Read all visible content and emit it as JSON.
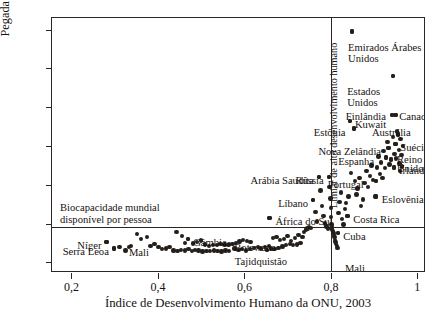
{
  "chart_data": {
    "type": "scatter",
    "title": "",
    "xlabel": "Índice de Desenvolvimento Humano da ONU, 2003",
    "ylabel": "Pegada ecológica per capita",
    "ylabel_plain": "Pegada ecológica ",
    "ylabel_italic": "per capita",
    "xlim": [
      0.155,
      1.02
    ],
    "ylim": [
      -0.55,
      12.6
    ],
    "grid": false,
    "legend": "none",
    "xticks": [
      0.2,
      0.4,
      0.6,
      0.8,
      1.0
    ],
    "xticklabels": [
      "0,2",
      "0,4",
      "0,6",
      "0,8",
      "1"
    ],
    "yticks": [
      0,
      2,
      4,
      6,
      8,
      10,
      12
    ],
    "yticklabels": [
      "0",
      "2",
      "4",
      "6",
      "8",
      "10",
      "12"
    ],
    "reference_lines": [
      {
        "name": "biocapacidade-mundial",
        "orientation": "horizontal",
        "value": 1.8,
        "label": "Biocapacidade mundial disponível por pessoa",
        "label_line1": "Biocapacidade mundial",
        "label_line2": "disponível por pessoa"
      },
      {
        "name": "limiar-alto-desenvolvimento",
        "orientation": "vertical",
        "value": 0.8,
        "label": "Limiar de alto desenvolvimento humano"
      }
    ],
    "annotated_points": [
      {
        "label": "Emirados Árabes Unidos",
        "x": 0.849,
        "y": 11.9
      },
      {
        "label": "Estados Unidos",
        "x": 0.944,
        "y": 9.6
      },
      {
        "label": "Canadá",
        "x": 0.949,
        "y": 7.6
      },
      {
        "label": "Finlândia",
        "x": 0.941,
        "y": 7.6
      },
      {
        "label": "Kuwait",
        "x": 0.844,
        "y": 7.3
      },
      {
        "label": "Austrália",
        "x": 0.955,
        "y": 6.6
      },
      {
        "label": "Estônia",
        "x": 0.853,
        "y": 6.9
      },
      {
        "label": "Suécia",
        "x": 0.949,
        "y": 6.1
      },
      {
        "label": "Nova Zelândia",
        "x": 0.933,
        "y": 5.9
      },
      {
        "label": "Espanha",
        "x": 0.928,
        "y": 5.4
      },
      {
        "label": "Reino Unido",
        "x": 0.939,
        "y": 5.3
      },
      {
        "label": "Irlanda",
        "x": 0.946,
        "y": 4.9
      },
      {
        "label": "Rússia",
        "x": 0.795,
        "y": 4.4
      },
      {
        "label": "Portugal",
        "x": 0.904,
        "y": 4.2
      },
      {
        "label": "Eslovênia",
        "x": 0.904,
        "y": 3.4
      },
      {
        "label": "Costa Rica",
        "x": 0.838,
        "y": 2.4
      },
      {
        "label": "Arábia Saudita",
        "x": 0.772,
        "y": 4.4
      },
      {
        "label": "Líbano",
        "x": 0.759,
        "y": 3.2
      },
      {
        "label": "África do Sul",
        "x": 0.658,
        "y": 2.3
      },
      {
        "label": "Cuba",
        "x": 0.817,
        "y": 1.5
      },
      {
        "label": "Gâmbia",
        "x": 0.47,
        "y": 1.2
      },
      {
        "label": "Botswana",
        "x": 0.565,
        "y": 0.95
      },
      {
        "label": "Tajidquistão",
        "x": 0.652,
        "y": 0.65
      },
      {
        "label": "Mali",
        "x": 0.333,
        "y": 0.8
      },
      {
        "label": "Níger",
        "x": 0.281,
        "y": 1.05
      },
      {
        "label": "Serra Leoa",
        "x": 0.298,
        "y": 0.72
      }
    ],
    "points": [
      [
        0.281,
        1.05
      ],
      [
        0.298,
        0.72
      ],
      [
        0.311,
        0.78
      ],
      [
        0.325,
        0.62
      ],
      [
        0.338,
        0.83
      ],
      [
        0.352,
        1.45
      ],
      [
        0.361,
        1.2
      ],
      [
        0.374,
        1.3
      ],
      [
        0.383,
        0.85
      ],
      [
        0.392,
        0.95
      ],
      [
        0.401,
        0.78
      ],
      [
        0.409,
        0.7
      ],
      [
        0.418,
        0.72
      ],
      [
        0.427,
        0.8
      ],
      [
        0.436,
        0.62
      ],
      [
        0.445,
        0.58
      ],
      [
        0.454,
        0.65
      ],
      [
        0.463,
        0.62
      ],
      [
        0.471,
        0.68
      ],
      [
        0.479,
        0.6
      ],
      [
        0.486,
        0.65
      ],
      [
        0.494,
        0.62
      ],
      [
        0.503,
        0.55
      ],
      [
        0.512,
        0.6
      ],
      [
        0.52,
        0.58
      ],
      [
        0.529,
        0.62
      ],
      [
        0.538,
        0.58
      ],
      [
        0.547,
        0.55
      ],
      [
        0.556,
        0.62
      ],
      [
        0.565,
        0.58
      ],
      [
        0.47,
        1.2
      ],
      [
        0.455,
        1.35
      ],
      [
        0.443,
        1.55
      ],
      [
        0.463,
        1.0
      ],
      [
        0.481,
        0.98
      ],
      [
        0.491,
        1.05
      ],
      [
        0.499,
        1.12
      ],
      [
        0.509,
        0.92
      ],
      [
        0.518,
        0.85
      ],
      [
        0.527,
        0.9
      ],
      [
        0.536,
        0.88
      ],
      [
        0.545,
        0.95
      ],
      [
        0.554,
        0.92
      ],
      [
        0.563,
        0.88
      ],
      [
        0.572,
        0.95
      ],
      [
        0.58,
        1.0
      ],
      [
        0.589,
        1.08
      ],
      [
        0.597,
        1.15
      ],
      [
        0.606,
        1.1
      ],
      [
        0.614,
        1.05
      ],
      [
        0.577,
        0.72
      ],
      [
        0.586,
        0.65
      ],
      [
        0.595,
        0.7
      ],
      [
        0.604,
        0.62
      ],
      [
        0.613,
        0.68
      ],
      [
        0.622,
        0.75
      ],
      [
        0.631,
        0.8
      ],
      [
        0.639,
        0.72
      ],
      [
        0.648,
        0.78
      ],
      [
        0.657,
        0.85
      ],
      [
        0.658,
        2.3
      ],
      [
        0.666,
        1.25
      ],
      [
        0.674,
        1.3
      ],
      [
        0.683,
        1.15
      ],
      [
        0.691,
        1.2
      ],
      [
        0.7,
        1.35
      ],
      [
        0.708,
        1.1
      ],
      [
        0.717,
        1.25
      ],
      [
        0.725,
        1.4
      ],
      [
        0.734,
        1.3
      ],
      [
        0.652,
        0.65
      ],
      [
        0.661,
        0.72
      ],
      [
        0.67,
        0.68
      ],
      [
        0.679,
        0.75
      ],
      [
        0.688,
        0.82
      ],
      [
        0.696,
        0.9
      ],
      [
        0.705,
        0.95
      ],
      [
        0.713,
        0.88
      ],
      [
        0.722,
        0.92
      ],
      [
        0.73,
        1.0
      ],
      [
        0.738,
        1.55
      ],
      [
        0.742,
        1.7
      ],
      [
        0.746,
        1.75
      ],
      [
        0.75,
        1.82
      ],
      [
        0.754,
        1.78
      ],
      [
        0.759,
        3.2
      ],
      [
        0.764,
        2.6
      ],
      [
        0.768,
        2.1
      ],
      [
        0.772,
        4.4
      ],
      [
        0.776,
        3.7
      ],
      [
        0.779,
        2.9
      ],
      [
        0.783,
        2.4
      ],
      [
        0.787,
        2.0
      ],
      [
        0.79,
        1.85
      ],
      [
        0.793,
        1.75
      ],
      [
        0.795,
        4.4
      ],
      [
        0.797,
        3.9
      ],
      [
        0.799,
        3.3
      ],
      [
        0.8,
        2.8
      ],
      [
        0.8,
        2.35
      ],
      [
        0.801,
        1.95
      ],
      [
        0.802,
        1.8
      ],
      [
        0.803,
        1.7
      ],
      [
        0.805,
        1.6
      ],
      [
        0.806,
        1.5
      ],
      [
        0.807,
        1.4
      ],
      [
        0.808,
        1.3
      ],
      [
        0.809,
        1.15
      ],
      [
        0.811,
        1.05
      ],
      [
        0.812,
        0.95
      ],
      [
        0.814,
        0.85
      ],
      [
        0.815,
        0.75
      ],
      [
        0.817,
        1.5
      ],
      [
        0.818,
        2.55
      ],
      [
        0.82,
        3.1
      ],
      [
        0.823,
        3.6
      ],
      [
        0.826,
        2.25
      ],
      [
        0.829,
        1.95
      ],
      [
        0.832,
        2.75
      ],
      [
        0.835,
        3.05
      ],
      [
        0.838,
        2.4
      ],
      [
        0.841,
        3.4
      ],
      [
        0.844,
        7.3
      ],
      [
        0.846,
        4.6
      ],
      [
        0.849,
        11.9
      ],
      [
        0.853,
        6.9
      ],
      [
        0.856,
        4.2
      ],
      [
        0.859,
        3.5
      ],
      [
        0.862,
        3.8
      ],
      [
        0.866,
        4.35
      ],
      [
        0.87,
        2.9
      ],
      [
        0.874,
        3.25
      ],
      [
        0.878,
        4.1
      ],
      [
        0.882,
        4.7
      ],
      [
        0.886,
        3.9
      ],
      [
        0.89,
        4.45
      ],
      [
        0.894,
        5.0
      ],
      [
        0.898,
        4.25
      ],
      [
        0.902,
        3.4
      ],
      [
        0.904,
        4.2
      ],
      [
        0.907,
        4.9
      ],
      [
        0.91,
        5.45
      ],
      [
        0.913,
        4.55
      ],
      [
        0.916,
        5.15
      ],
      [
        0.919,
        4.35
      ],
      [
        0.922,
        5.75
      ],
      [
        0.925,
        4.85
      ],
      [
        0.928,
        5.4
      ],
      [
        0.931,
        6.2
      ],
      [
        0.933,
        5.9
      ],
      [
        0.936,
        5.05
      ],
      [
        0.939,
        5.3
      ],
      [
        0.941,
        7.6
      ],
      [
        0.943,
        6.45
      ],
      [
        0.944,
        9.6
      ],
      [
        0.946,
        4.9
      ],
      [
        0.947,
        5.6
      ],
      [
        0.949,
        7.6
      ],
      [
        0.949,
        6.1
      ],
      [
        0.951,
        5.35
      ],
      [
        0.953,
        6.75
      ],
      [
        0.955,
        6.6
      ],
      [
        0.957,
        5.8
      ],
      [
        0.959,
        5.1
      ],
      [
        0.961,
        6.35
      ],
      [
        0.963,
        5.55
      ],
      [
        0.965,
        4.95
      ],
      [
        0.967,
        6.0
      ],
      [
        0.904,
        3.4
      ],
      [
        0.96,
        4.7
      ]
    ]
  }
}
